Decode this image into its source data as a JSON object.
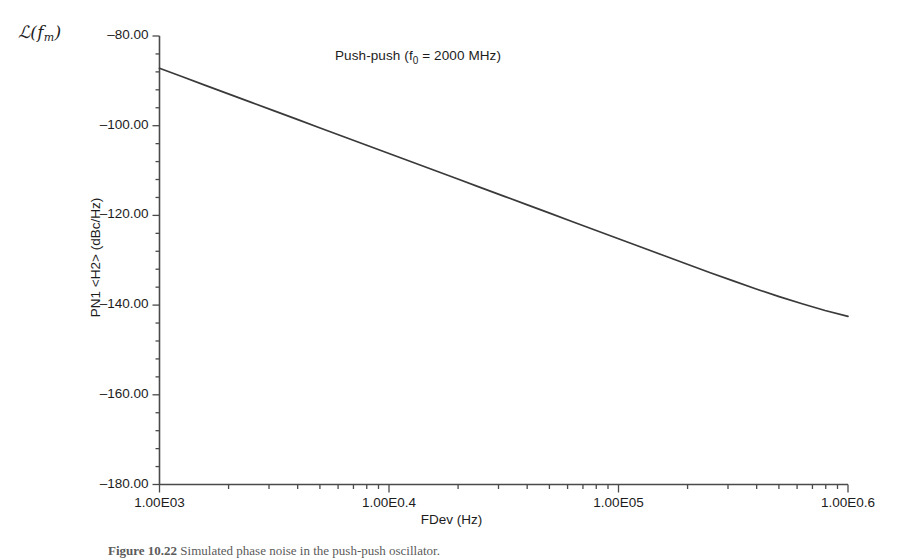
{
  "figure": {
    "ornament_symbol": "ℒ(",
    "ornament_sub": "f",
    "ornament_sub_m": "m",
    "ornament_close": ")",
    "caption_label": "Figure 10.22",
    "caption_text": "Simulated phase noise in the push-push oscillator."
  },
  "chart_data": {
    "type": "line",
    "title": "Push-push (f0 = 2000 MHz)",
    "title_main": "Push-push (f",
    "title_sub": "0",
    "title_rest": " = 2000 MHz)",
    "xlabel": "FDev (Hz)",
    "ylabel": "PN1 <H2> (dBc/Hz)",
    "xscale": "log",
    "xlim": [
      1000,
      1000000
    ],
    "ylim": [
      -180,
      -80
    ],
    "grid": false,
    "legend": null,
    "x_tick_labels": [
      "1.00E03",
      "1.00E0.4",
      "1.00E05",
      "1.00E0.6"
    ],
    "x_tick_values": [
      1000,
      10000,
      100000,
      1000000
    ],
    "y_tick_labels": [
      "-80.00",
      "-100.00",
      "-120.00",
      "-140.00",
      "-160.00",
      "-180.00"
    ],
    "y_tick_values": [
      -80,
      -100,
      -120,
      -140,
      -160,
      -180
    ],
    "y_minor_per_major": 4,
    "series": [
      {
        "name": "PN1 <H2>",
        "color": "#3a3a3a",
        "x": [
          1000,
          1259,
          1585,
          1995,
          2512,
          3162,
          3981,
          5012,
          6310,
          7943,
          10000,
          12590,
          15850,
          19950,
          25120,
          31620,
          39810,
          50120,
          63100,
          79430,
          100000,
          125900,
          158500,
          199500,
          251200,
          316200,
          398100,
          501200,
          631000,
          794300,
          1000000
        ],
        "y": [
          -87.2,
          -89.1,
          -91.0,
          -92.9,
          -94.8,
          -96.7,
          -98.6,
          -100.5,
          -102.4,
          -104.3,
          -106.2,
          -108.1,
          -110.0,
          -111.9,
          -113.8,
          -115.7,
          -117.6,
          -119.5,
          -121.4,
          -123.3,
          -125.2,
          -127.1,
          -129.0,
          -130.9,
          -132.8,
          -134.6,
          -136.4,
          -138.1,
          -139.7,
          -141.2,
          -142.5
        ]
      }
    ],
    "series_note": "single trace, monotonically decreasing, slope flattens toward high offset"
  }
}
